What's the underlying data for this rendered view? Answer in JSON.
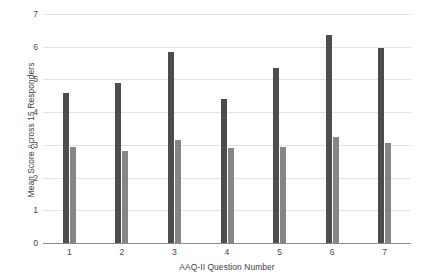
{
  "chart_data": {
    "type": "bar",
    "title": "",
    "xlabel": "AAQ-II Question Number",
    "ylabel": "Mean Score Across 15 Responders",
    "categories": [
      "1",
      "2",
      "3",
      "4",
      "5",
      "6",
      "7"
    ],
    "ylim": [
      0,
      7
    ],
    "yticks": [
      "0",
      "1",
      "2",
      "3",
      "4",
      "5",
      "6",
      "7"
    ],
    "grid": true,
    "legend": "none",
    "series": [
      {
        "name": "series-1",
        "color": "#4d4d4d",
        "values": [
          4.6,
          4.9,
          5.85,
          4.4,
          5.35,
          6.35,
          5.95
        ]
      },
      {
        "name": "series-2",
        "color": "#868686",
        "values": [
          2.95,
          2.8,
          3.15,
          2.9,
          2.95,
          3.25,
          3.05
        ]
      }
    ]
  }
}
